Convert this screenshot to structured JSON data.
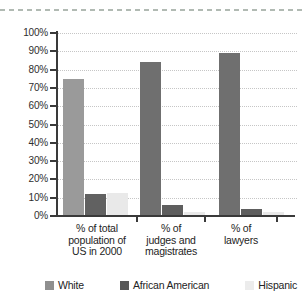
{
  "decor": {
    "top_rule_color": "#b1bab3"
  },
  "chart_data": {
    "type": "bar",
    "title": "",
    "xlabel": "",
    "ylabel": "",
    "ylim": [
      0,
      100
    ],
    "ytick_step": 10,
    "ytick_suffix": "%",
    "grid": "horizontal-dotted",
    "legend_position": "bottom",
    "axis_color": "#3a3a3a",
    "gridline_color": "#c6c6c6",
    "categories": [
      "% of total population of US in 2000",
      "% of judges and magistrates",
      "% of lawyers"
    ],
    "category_label_lines": [
      [
        "% of total",
        "population of",
        "US in 2000"
      ],
      [
        "% of",
        "judges and",
        "magistrates"
      ],
      [
        "% of",
        "lawyers"
      ]
    ],
    "series": [
      {
        "name": "White",
        "legend_color": "#8f8f8f",
        "bar_colors": [
          "#9a9a9a",
          "#6f6f6f",
          "#6f6f6f"
        ],
        "values": [
          75,
          84,
          89
        ]
      },
      {
        "name": "African American",
        "legend_color": "#595959",
        "bar_colors": [
          "#616161",
          "#5e5e5e",
          "#5e5e5e"
        ],
        "values": [
          12,
          6,
          4
        ]
      },
      {
        "name": "Hispanic",
        "legend_color": "#ececec",
        "bar_colors": [
          "#e9e9e9",
          "#e9e9e9",
          "#e9e9e9"
        ],
        "values": [
          12.5,
          2,
          2
        ]
      }
    ]
  }
}
